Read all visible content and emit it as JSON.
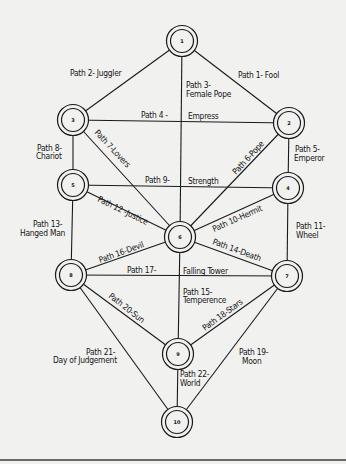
{
  "diagram": {
    "type": "tree-of-life",
    "colors": {
      "background": "#f1f1f0",
      "ink": "#1a1a1a",
      "rule": "#6a6a6a"
    },
    "nodes": [
      {
        "id": "1",
        "label": "1",
        "x": 182,
        "y": 41
      },
      {
        "id": "2",
        "label": "2",
        "x": 289,
        "y": 123
      },
      {
        "id": "3",
        "label": "3",
        "x": 73,
        "y": 120
      },
      {
        "id": "4",
        "label": "4",
        "x": 288,
        "y": 188
      },
      {
        "id": "5",
        "label": "5",
        "x": 73,
        "y": 185
      },
      {
        "id": "6",
        "label": "6",
        "x": 180,
        "y": 237
      },
      {
        "id": "7",
        "label": "7",
        "x": 287,
        "y": 276
      },
      {
        "id": "8",
        "label": "8",
        "x": 71,
        "y": 275
      },
      {
        "id": "9",
        "label": "9",
        "x": 178,
        "y": 354
      },
      {
        "id": "10",
        "label": "10",
        "x": 177,
        "y": 422
      }
    ],
    "paths": [
      {
        "n": 1,
        "from": "1",
        "to": "2",
        "label": "Path 1- Fool"
      },
      {
        "n": 2,
        "from": "1",
        "to": "3",
        "label": "Path 2- Juggler"
      },
      {
        "n": 3,
        "from": "1",
        "to": "6",
        "label_line1": "Path 3-",
        "label_line2": "Female Pope"
      },
      {
        "n": 4,
        "from": "3",
        "to": "2",
        "label_left": "Path 4 -",
        "label_right": "Empress"
      },
      {
        "n": 5,
        "from": "2",
        "to": "4",
        "label_line1": "Path 5-",
        "label_line2": "Emperor"
      },
      {
        "n": 6,
        "from": "2",
        "to": "6",
        "label": "Path 6-Pope"
      },
      {
        "n": 7,
        "from": "3",
        "to": "6",
        "label": "Path 7-Lovers"
      },
      {
        "n": 8,
        "from": "3",
        "to": "5",
        "label_line1": "Path 8-",
        "label_line2": "Chariot"
      },
      {
        "n": 9,
        "from": "5",
        "to": "4",
        "label_left": "Path 9-",
        "label_right": "Strength"
      },
      {
        "n": 10,
        "from": "4",
        "to": "6",
        "label": "Path 10-Hermit"
      },
      {
        "n": 11,
        "from": "4",
        "to": "7",
        "label_line1": "Path 11-",
        "label_line2": "Wheel"
      },
      {
        "n": 12,
        "from": "5",
        "to": "6",
        "label": "Path 12 -Justice"
      },
      {
        "n": 13,
        "from": "5",
        "to": "8",
        "label_line1": "Path 13-",
        "label_line2": "Hanged Man"
      },
      {
        "n": 14,
        "from": "6",
        "to": "7",
        "label": "Path 14-Death"
      },
      {
        "n": 15,
        "from": "6",
        "to": "9",
        "label_line1": "Path 15-",
        "label_line2": "Temperence"
      },
      {
        "n": 16,
        "from": "8",
        "to": "6",
        "label": "Path 16-Devil"
      },
      {
        "n": 17,
        "from": "8",
        "to": "7",
        "label_left": "Path 17-",
        "label_right": "Falling Tower"
      },
      {
        "n": 18,
        "from": "9",
        "to": "7",
        "label": "Path 18-Stars"
      },
      {
        "n": 19,
        "from": "7",
        "to": "10",
        "label_line1": "Path 19-",
        "label_line2": "Moon"
      },
      {
        "n": 20,
        "from": "8",
        "to": "9",
        "label": "Path 20-Sun"
      },
      {
        "n": 21,
        "from": "8",
        "to": "10",
        "label_line1": "Path 21-",
        "label_line2": "Day of Judgement"
      },
      {
        "n": 22,
        "from": "9",
        "to": "10",
        "label_line1": "Path 22-",
        "label_line2": "World"
      }
    ]
  }
}
